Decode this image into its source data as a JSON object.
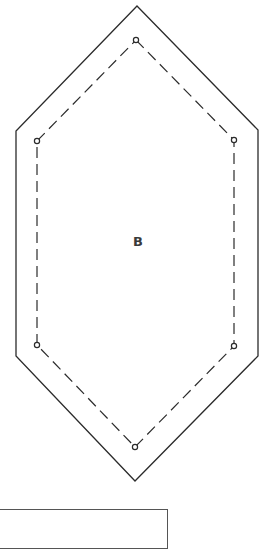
{
  "template": {
    "piece_label": "B",
    "shape": "elongated-hexagon",
    "colors": {
      "cut_line": "#2b2b2b",
      "seam_line": "#2b2b2b",
      "label": "#3a3a3a",
      "background": "#ffffff"
    },
    "cut_line": {
      "style": "solid",
      "points": [
        [
          137,
          6
        ],
        [
          258,
          130
        ],
        [
          258,
          356
        ],
        [
          135,
          481
        ],
        [
          16,
          356
        ],
        [
          16,
          131
        ]
      ]
    },
    "seam_line": {
      "style": "dashed",
      "points": [
        [
          136,
          40
        ],
        [
          234,
          140
        ],
        [
          234,
          346
        ],
        [
          135,
          447
        ],
        [
          37,
          345
        ],
        [
          37,
          141
        ]
      ]
    },
    "seam_corner_markers": 6
  },
  "partial_box": {
    "visible": true
  }
}
